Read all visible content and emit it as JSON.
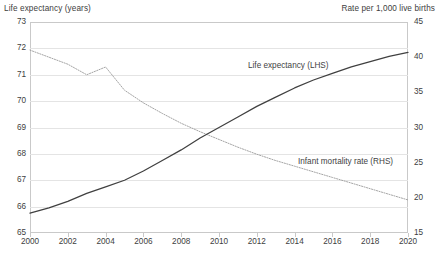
{
  "axis_captions": {
    "left": "Life expectancy (years)",
    "right": "Rate per 1,000 live births"
  },
  "labels": {
    "life_expectancy": "Life expectancy (LHS)",
    "infant_mortality": "Infant mortality rate (RHS)"
  },
  "colors": {
    "life_expectancy_line": "#404040",
    "infant_mortality_line": "#9a9a9a",
    "gridline": "#e4e4e4",
    "axis": "#c9c9c9",
    "text": "#404040",
    "background": "#ffffff"
  },
  "chart_data": {
    "type": "line",
    "title": "",
    "xlabel": "",
    "ylabel": "Life expectancy (years)",
    "y2label": "Rate per 1,000 live births",
    "grid": true,
    "legend": "inline-annotations",
    "x": [
      2000,
      2001,
      2002,
      2003,
      2004,
      2005,
      2006,
      2007,
      2008,
      2009,
      2010,
      2011,
      2012,
      2013,
      2014,
      2015,
      2016,
      2017,
      2018,
      2019,
      2020
    ],
    "xticks": [
      2000,
      2002,
      2004,
      2006,
      2008,
      2010,
      2012,
      2014,
      2016,
      2018,
      2020
    ],
    "xlim": [
      2000,
      2020
    ],
    "ylim": [
      65,
      73
    ],
    "yticks": [
      65,
      66,
      67,
      68,
      69,
      70,
      71,
      72,
      73
    ],
    "y2lim": [
      15,
      45
    ],
    "y2ticks": [
      15,
      20,
      25,
      30,
      35,
      40,
      45
    ],
    "series": [
      {
        "name": "Life expectancy (LHS)",
        "axis": "left",
        "style": "solid",
        "units": "years",
        "values": [
          65.75,
          65.95,
          66.2,
          66.5,
          66.75,
          67.0,
          67.35,
          67.75,
          68.15,
          68.6,
          69.0,
          69.4,
          69.8,
          70.15,
          70.5,
          70.8,
          71.05,
          71.3,
          71.5,
          71.7,
          71.85
        ]
      },
      {
        "name": "Infant mortality rate (RHS)",
        "axis": "right",
        "style": "dotted",
        "units": "per 1,000 live births",
        "values": [
          41.0,
          40.0,
          39.0,
          37.5,
          38.6,
          35.3,
          33.5,
          32.0,
          30.6,
          29.4,
          28.3,
          27.2,
          26.2,
          25.3,
          24.5,
          23.7,
          22.9,
          22.1,
          21.3,
          20.5,
          19.7
        ]
      }
    ]
  }
}
